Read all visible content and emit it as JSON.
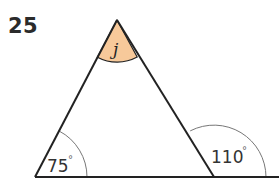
{
  "problem": {
    "number": "25"
  },
  "figure": {
    "type": "triangle-with-exterior-angle",
    "vertices": {
      "apex": [
        117,
        20
      ],
      "bottom_left": [
        35,
        177
      ],
      "bottom_right": [
        214,
        177
      ]
    },
    "baseline": {
      "from": [
        35,
        177
      ],
      "to": [
        279,
        177
      ]
    },
    "angles": {
      "apex": {
        "label": "j",
        "kind": "unknown",
        "fill": "#f7c99a",
        "radius": 42
      },
      "bottom_left_interior": {
        "value": "75",
        "unit": "°",
        "radius": 52
      },
      "bottom_right_exterior": {
        "value": "110",
        "unit": "°",
        "radius": 52
      }
    },
    "colors": {
      "stroke": "#222222",
      "arc": "#777777",
      "highlight_fill": "#f7c99a"
    }
  }
}
